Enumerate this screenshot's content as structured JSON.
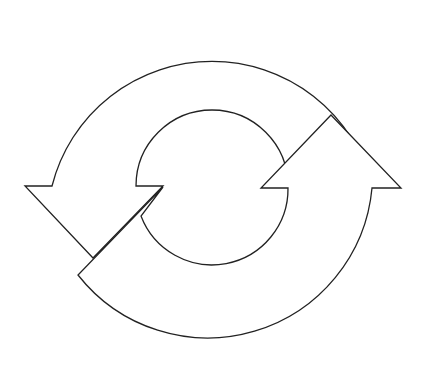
{
  "diagram": {
    "type": "cycle-arrows",
    "arrows": [
      {
        "name": "upper-left-arrow",
        "direction": "counterclockwise-down"
      },
      {
        "name": "lower-right-arrow",
        "direction": "counterclockwise-up"
      }
    ],
    "colors": {
      "stroke": "#222222",
      "fill": "#ffffff",
      "background": "#ffffff"
    }
  }
}
